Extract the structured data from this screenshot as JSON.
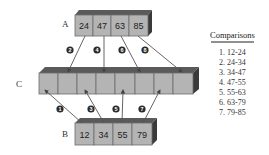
{
  "diagram": {
    "type": "merge-sort-merge-step",
    "arrays": {
      "A": {
        "label": "A",
        "values": [
          "24",
          "47",
          "63",
          "85"
        ]
      },
      "B": {
        "label": "B",
        "values": [
          "12",
          "34",
          "55",
          "79"
        ]
      },
      "C": {
        "label": "C",
        "cells": 8
      }
    },
    "steps_top": [
      "2",
      "4",
      "6",
      "8"
    ],
    "steps_bottom": [
      "1",
      "3",
      "5",
      "7"
    ],
    "comparisons": {
      "title": "Comparisons",
      "items": [
        "1.  12-24",
        "2.  24-34",
        "3.  34-47",
        "4.  47-55",
        "5.  55-63",
        "6.  63-79",
        "7.  79-85"
      ]
    },
    "colors": {
      "cell_face": "#b4b4b4",
      "cell_top": "#5a5a5a",
      "cell_side": "#3a3a3a",
      "cell_border": "#6b6b6b",
      "arrow": "#555555",
      "step_circle": "#2a2a2a"
    }
  }
}
